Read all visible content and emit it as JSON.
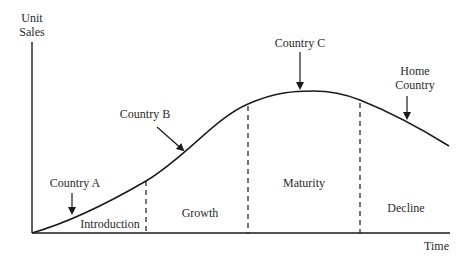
{
  "diagram": {
    "type": "product-life-cycle",
    "axes": {
      "y_label_line1": "Unit",
      "y_label_line2": "Sales",
      "x_label": "Time"
    },
    "stages": [
      {
        "label": "Introduction"
      },
      {
        "label": "Growth"
      },
      {
        "label": "Maturity"
      },
      {
        "label": "Decline"
      }
    ],
    "markers": [
      {
        "label": "Country A"
      },
      {
        "label": "Country B"
      },
      {
        "label": "Country C"
      },
      {
        "label_line1": "Home",
        "label_line2": "Country"
      }
    ],
    "colors": {
      "line": "#1a1a1a",
      "text": "#2a2a2a",
      "background": "#ffffff"
    }
  }
}
